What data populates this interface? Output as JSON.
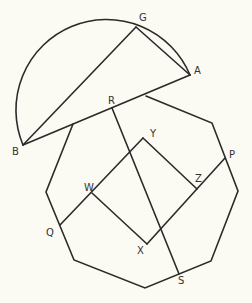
{
  "diagram": {
    "colors": {
      "background": "#fbfaf3",
      "stroke": "#2a2a2a",
      "label": "#333333"
    },
    "points": {
      "G": {
        "label": "G",
        "x": 136,
        "y": 27
      },
      "A": {
        "label": "A",
        "x": 190,
        "y": 75
      },
      "B": {
        "label": "B",
        "x": 23,
        "y": 145
      },
      "R": {
        "label": "R",
        "x": 112,
        "y": 108
      },
      "Y": {
        "label": "Y",
        "x": 143,
        "y": 138
      },
      "P": {
        "label": "P",
        "x": 225,
        "y": 158
      },
      "Z": {
        "label": "Z",
        "x": 197,
        "y": 189
      },
      "W": {
        "label": "W",
        "x": 92,
        "y": 193
      },
      "Q": {
        "label": "Q",
        "x": 60,
        "y": 225
      },
      "X": {
        "label": "X",
        "x": 147,
        "y": 244
      },
      "S": {
        "label": "S",
        "x": 179,
        "y": 274
      }
    },
    "labels": [
      {
        "text": "G",
        "x": 139,
        "y": 21
      },
      {
        "text": "A",
        "x": 194,
        "y": 74
      },
      {
        "text": "B",
        "x": 12,
        "y": 155
      },
      {
        "text": "R",
        "x": 108,
        "y": 104
      },
      {
        "text": "Y",
        "x": 150,
        "y": 137
      },
      {
        "text": "P",
        "x": 229,
        "y": 158
      },
      {
        "text": "Z",
        "x": 195,
        "y": 182
      },
      {
        "text": "W",
        "x": 84,
        "y": 191
      },
      {
        "text": "Q",
        "x": 46,
        "y": 236
      },
      {
        "text": "X",
        "x": 137,
        "y": 254
      },
      {
        "text": "S",
        "x": 178,
        "y": 284
      }
    ]
  }
}
